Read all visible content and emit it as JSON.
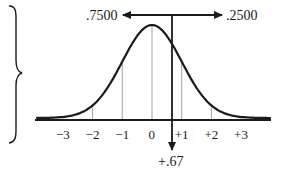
{
  "diagram": {
    "type": "normal-distribution-curve",
    "left_area_label": ".7500",
    "right_area_label": ".2500",
    "z_marker_label": "+.67",
    "z_value": 0.67,
    "axis_ticks": [
      "−3",
      "−2",
      "−1",
      "0",
      "+1",
      "+2",
      "+3"
    ],
    "tick_values": [
      -3,
      -2,
      -1,
      0,
      1,
      2,
      3
    ],
    "colors": {
      "ink": "#1a1a1a",
      "grid": "#8a8a8a",
      "background": "#ffffff"
    }
  },
  "chart_data": {
    "type": "line",
    "title": "",
    "xlabel": "z",
    "ylabel": "",
    "x": [
      -3,
      -2,
      -1,
      0,
      1,
      2,
      3
    ],
    "categories": [
      "−3",
      "−2",
      "−1",
      "0",
      "+1",
      "+2",
      "+3"
    ],
    "series": [
      {
        "name": "standard normal density",
        "values": [
          0.0044,
          0.054,
          0.242,
          0.399,
          0.242,
          0.054,
          0.0044
        ]
      }
    ],
    "annotations": [
      {
        "text": ".7500",
        "meaning": "area to the left of z = +.67",
        "position": "top-left arrow"
      },
      {
        "text": ".2500",
        "meaning": "area to the right of z = +.67",
        "position": "top-right arrow"
      },
      {
        "text": "+.67",
        "meaning": "z cut-off marker",
        "position": "below axis at z=0.67"
      }
    ],
    "grid": true,
    "xlim": [
      -3.8,
      4.0
    ]
  }
}
